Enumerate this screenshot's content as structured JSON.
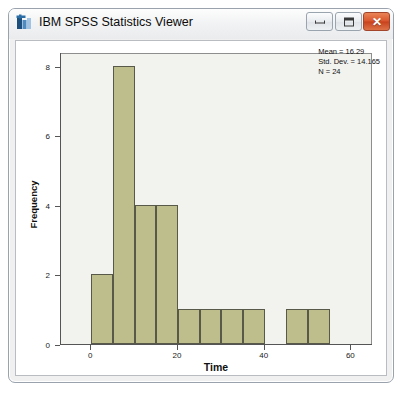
{
  "window": {
    "title": "IBM SPSS Statistics Viewer",
    "icon": "spss-app-icon",
    "controls": {
      "minimize": {
        "label": "Minimize",
        "icon": "minimize-icon",
        "glyph": ""
      },
      "maximize": {
        "label": "Maximize",
        "icon": "maximize-icon",
        "glyph": ""
      },
      "close": {
        "label": "Close",
        "icon": "close-icon",
        "glyph": "✕"
      }
    }
  },
  "page_caption": "",
  "chart_data": {
    "type": "bar",
    "subtype": "histogram",
    "title": "",
    "xlabel": "Time",
    "ylabel": "Frequency",
    "xlim": [
      -7,
      65
    ],
    "ylim": [
      0,
      8.4
    ],
    "xticks": [
      0,
      20,
      40,
      60
    ],
    "yticks": [
      0,
      2,
      4,
      6,
      8
    ],
    "xtick_labels": [
      "0",
      "20",
      "40",
      "60"
    ],
    "ytick_labels": [
      "0",
      "2",
      "4",
      "6",
      "8"
    ],
    "grid": false,
    "legend": "none",
    "bin_width": 5,
    "bar_color": "#BDBE8C",
    "bar_edge_color": "#59594A",
    "plot_background": "#F2F2EF",
    "bins": [
      {
        "start": 0,
        "end": 5,
        "center": 2.5,
        "count": 2
      },
      {
        "start": 5,
        "end": 10,
        "center": 7.5,
        "count": 8
      },
      {
        "start": 10,
        "end": 15,
        "center": 12.5,
        "count": 4
      },
      {
        "start": 15,
        "end": 20,
        "center": 17.5,
        "count": 4
      },
      {
        "start": 20,
        "end": 25,
        "center": 22.5,
        "count": 1
      },
      {
        "start": 25,
        "end": 30,
        "center": 27.5,
        "count": 1
      },
      {
        "start": 30,
        "end": 35,
        "center": 32.5,
        "count": 1
      },
      {
        "start": 35,
        "end": 40,
        "center": 37.5,
        "count": 1
      },
      {
        "start": 40,
        "end": 45,
        "center": 42.5,
        "count": 0
      },
      {
        "start": 45,
        "end": 50,
        "center": 47.5,
        "count": 1
      },
      {
        "start": 50,
        "end": 55,
        "center": 52.5,
        "count": 1
      }
    ],
    "categories": [
      "0-5",
      "5-10",
      "10-15",
      "15-20",
      "20-25",
      "25-30",
      "30-35",
      "35-40",
      "40-45",
      "45-50",
      "50-55"
    ],
    "values": [
      2,
      8,
      4,
      4,
      1,
      1,
      1,
      1,
      0,
      1,
      1
    ],
    "annotation": {
      "mean_label": "Mean = 16.29",
      "std_dev_label": "Std. Dev. = 14.165",
      "n_label": "N = 24",
      "mean": 16.29,
      "std_dev": 14.165,
      "n": 24
    }
  }
}
